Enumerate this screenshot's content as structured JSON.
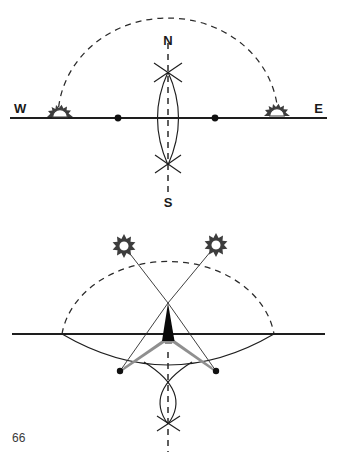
{
  "page": {
    "width": 337,
    "height": 460,
    "background": "#ffffff",
    "page_number": "66"
  },
  "figure": {
    "title": "",
    "caption": "",
    "ink_color": "#1e1e1e",
    "shadow_color": "#8f8f8f",
    "sun_color": "#3a3a3a"
  },
  "top_diagram": {
    "name": "sun-path-horizon-view",
    "labels": {
      "west": "W",
      "east": "E",
      "north": "N",
      "south": "S"
    },
    "horizon": {
      "x1": 10,
      "y1": 118,
      "x2": 327,
      "y2": 118
    },
    "sun_arc": {
      "style": "dashed",
      "cx": 168,
      "cy": 118,
      "rx": 110,
      "ry": 100
    },
    "meridian_axis": {
      "style": "dashed",
      "x": 168,
      "y1": 43,
      "y2": 192
    },
    "vesica": {
      "cx": 168,
      "top_y": 72,
      "bottom_y": 165,
      "half_width": 21
    },
    "cross_marks": [
      {
        "name": "upper-cross",
        "x": 168,
        "y": 72
      },
      {
        "name": "lower-cross",
        "x": 168,
        "y": 164
      }
    ],
    "horizon_dots": [
      {
        "name": "west-shadow-tip-dot",
        "x": 118,
        "y": 118
      },
      {
        "name": "east-shadow-tip-dot",
        "x": 215,
        "y": 118
      }
    ],
    "suns": [
      {
        "name": "sunset-sun-west",
        "x": 60,
        "y": 116,
        "half": true
      },
      {
        "name": "sunrise-sun-east",
        "x": 277,
        "y": 114,
        "half": true
      }
    ]
  },
  "bottom_diagram": {
    "name": "gnomon-shadow-construction",
    "horizon": {
      "x1": 12,
      "y1": 334,
      "x2": 325,
      "y2": 334
    },
    "sun_arc": {
      "style": "dashed",
      "cx": 168,
      "cy": 318,
      "rx": 107,
      "ry": 84
    },
    "ground_arc": {
      "style": "solid",
      "cx": 168,
      "cy": 272,
      "rx": 107,
      "ry": 96
    },
    "apex": {
      "x": 168,
      "y": 303
    },
    "suns": [
      {
        "name": "sun-morning-left",
        "x": 124,
        "y": 246
      },
      {
        "name": "sun-afternoon-right",
        "x": 216,
        "y": 245
      }
    ],
    "rays": [
      {
        "name": "ray-left",
        "x1": 124,
        "y1": 246,
        "x2": 168,
        "y2": 303
      },
      {
        "name": "ray-right",
        "x1": 216,
        "y1": 245,
        "x2": 168,
        "y2": 303
      }
    ],
    "shadow_lines": [
      {
        "name": "shadow-line-left",
        "x1": 168,
        "y1": 303,
        "x2": 120,
        "y2": 371
      },
      {
        "name": "shadow-line-right",
        "x1": 168,
        "y1": 303,
        "x2": 216,
        "y2": 371
      }
    ],
    "gnomon": {
      "name": "gnomon-style",
      "apex_x": 168,
      "apex_y": 303,
      "base_left_x": 163,
      "base_right_x": 174,
      "base_y": 340
    },
    "shadow_arms": [
      {
        "name": "shadow-arm-left",
        "tip_x": 120,
        "tip_y": 371
      },
      {
        "name": "shadow-arm-right",
        "tip_x": 216,
        "tip_y": 371
      }
    ],
    "shadow_tip_dots": [
      {
        "name": "shadow-tip-dot-left",
        "x": 120,
        "y": 371
      },
      {
        "name": "shadow-tip-dot-right",
        "x": 216,
        "y": 371
      }
    ],
    "meridian_axis": {
      "style": "dashed",
      "x": 168,
      "y1": 352,
      "y2": 452
    },
    "bisector_vesica": {
      "cx": 168,
      "top_y": 362,
      "bottom_y": 424,
      "half_width": 24
    },
    "cross_mark": {
      "name": "bisector-cross",
      "x": 168,
      "y": 423
    }
  }
}
